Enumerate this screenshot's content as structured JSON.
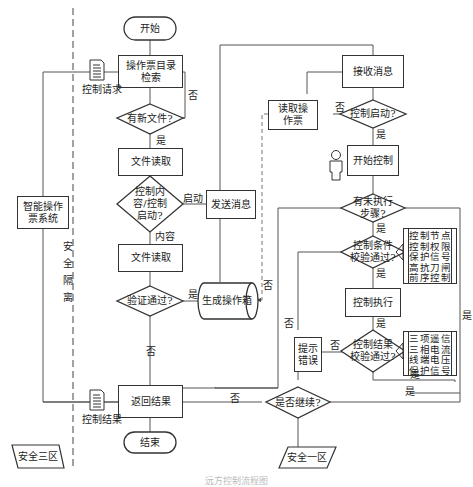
{
  "title": "",
  "zones": {
    "left_zone": "安全三区",
    "right_zone": "安全一区",
    "isolation": [
      "安",
      "全",
      "隔",
      "离"
    ]
  },
  "nodes": {
    "start": "开始",
    "catalog_search": "操作票目录检索",
    "has_new_file": "有新文件?",
    "file_read_1": "文件读取",
    "content_or_start": "控制内容/控制启动?",
    "file_read_2": "文件读取",
    "verify_pass": "验证通过?",
    "generate_box": "生成操作箱",
    "send_message": "发送消息",
    "return_result": "返回结果",
    "end": "结束",
    "smart_system": "智能操作票系统",
    "control_request": "控制请求",
    "control_result": "控制结果",
    "receive_message": "接收消息",
    "read_ticket": "读取操作票",
    "control_start_q": "控制启动?",
    "start_control": "开始控制",
    "unexecuted_steps": "有未执行步骤?",
    "condition_check": "控制条件校验通过?",
    "control_execute": "控制执行",
    "result_check": "控制结果校验通过?",
    "prompt_error": "提示错误",
    "continue_q": "是否继续?"
  },
  "notes": {
    "condition_items": [
      "控制节点",
      "控制权限",
      "保护信号",
      "高抗刀闸",
      "前序控制"
    ],
    "result_items": [
      "三项遥信",
      "三相电流",
      "线端电压",
      "保护信号"
    ]
  },
  "labels": {
    "no": "否",
    "yes": "是",
    "start_branch": "启动",
    "content_branch": "内容"
  },
  "caption": "远方控制流程图"
}
